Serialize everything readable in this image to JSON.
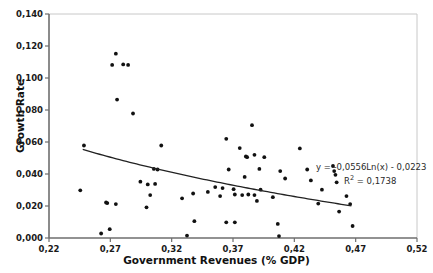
{
  "chart_data": {
    "type": "scatter",
    "title": "",
    "xlabel": "Government Revenues (% GDP)",
    "ylabel": "Growth Rate",
    "xlim": [
      0.22,
      0.52
    ],
    "ylim": [
      0.0,
      0.14
    ],
    "xticks": [
      "0,22",
      "0,27",
      "0,32",
      "0,37",
      "0,42",
      "0,47",
      "0,52"
    ],
    "xtick_values": [
      0.22,
      0.27,
      0.32,
      0.37,
      0.42,
      0.47,
      0.52
    ],
    "yticks": [
      "0,000",
      "0,020",
      "0,040",
      "0,060",
      "0,080",
      "0,100",
      "0,120",
      "0,140"
    ],
    "ytick_values": [
      0.0,
      0.02,
      0.04,
      0.06,
      0.08,
      0.1,
      0.12,
      0.14
    ],
    "grid": false,
    "legend": "none",
    "marker_color": "#111111",
    "trendline_color": "#222222",
    "axis_color": "#808080",
    "annotations": {
      "equation": "y = -0,0556Ln(x) - 0,0223",
      "r_squared_prefix": "R",
      "r_squared_exponent": "2",
      "r_squared_value": " = 0,1738"
    },
    "trendline": {
      "type": "logarithmic",
      "coefficient": -0.0556,
      "intercept": -0.0223,
      "r_squared": 0.1738,
      "x_start": 0.2475,
      "x_end": 0.4665
    },
    "points": [
      {
        "x": 0.2745,
        "y": 0.1152
      },
      {
        "x": 0.2715,
        "y": 0.1082
      },
      {
        "x": 0.2805,
        "y": 0.1085
      },
      {
        "x": 0.2845,
        "y": 0.1082
      },
      {
        "x": 0.2755,
        "y": 0.0865
      },
      {
        "x": 0.2885,
        "y": 0.0778
      },
      {
        "x": 0.3855,
        "y": 0.0705
      },
      {
        "x": 0.3645,
        "y": 0.062
      },
      {
        "x": 0.2485,
        "y": 0.0578
      },
      {
        "x": 0.3115,
        "y": 0.0578
      },
      {
        "x": 0.3755,
        "y": 0.0562
      },
      {
        "x": 0.4245,
        "y": 0.056
      },
      {
        "x": 0.3875,
        "y": 0.052
      },
      {
        "x": 0.3805,
        "y": 0.051
      },
      {
        "x": 0.3815,
        "y": 0.0505
      },
      {
        "x": 0.3955,
        "y": 0.0505
      },
      {
        "x": 0.4515,
        "y": 0.045
      },
      {
        "x": 0.3055,
        "y": 0.0432
      },
      {
        "x": 0.3085,
        "y": 0.0428
      },
      {
        "x": 0.3665,
        "y": 0.0428
      },
      {
        "x": 0.3915,
        "y": 0.0432
      },
      {
        "x": 0.4305,
        "y": 0.0428
      },
      {
        "x": 0.4525,
        "y": 0.0418
      },
      {
        "x": 0.4085,
        "y": 0.0418
      },
      {
        "x": 0.4535,
        "y": 0.0395
      },
      {
        "x": 0.3795,
        "y": 0.0382
      },
      {
        "x": 0.4125,
        "y": 0.0372
      },
      {
        "x": 0.2945,
        "y": 0.0352
      },
      {
        "x": 0.4335,
        "y": 0.036
      },
      {
        "x": 0.3005,
        "y": 0.0335
      },
      {
        "x": 0.3065,
        "y": 0.0338
      },
      {
        "x": 0.4545,
        "y": 0.0348
      },
      {
        "x": 0.3555,
        "y": 0.0318
      },
      {
        "x": 0.3615,
        "y": 0.0312
      },
      {
        "x": 0.3705,
        "y": 0.0305
      },
      {
        "x": 0.3925,
        "y": 0.0302
      },
      {
        "x": 0.4425,
        "y": 0.0302
      },
      {
        "x": 0.2455,
        "y": 0.0298
      },
      {
        "x": 0.3495,
        "y": 0.0288
      },
      {
        "x": 0.3025,
        "y": 0.0268
      },
      {
        "x": 0.3375,
        "y": 0.0278
      },
      {
        "x": 0.3715,
        "y": 0.0272
      },
      {
        "x": 0.3775,
        "y": 0.0268
      },
      {
        "x": 0.3825,
        "y": 0.0272
      },
      {
        "x": 0.3875,
        "y": 0.0268
      },
      {
        "x": 0.3595,
        "y": 0.0262
      },
      {
        "x": 0.4625,
        "y": 0.0262
      },
      {
        "x": 0.4025,
        "y": 0.0255
      },
      {
        "x": 0.3285,
        "y": 0.0248
      },
      {
        "x": 0.2665,
        "y": 0.0222
      },
      {
        "x": 0.2675,
        "y": 0.0218
      },
      {
        "x": 0.2745,
        "y": 0.0212
      },
      {
        "x": 0.3895,
        "y": 0.0232
      },
      {
        "x": 0.4655,
        "y": 0.0212
      },
      {
        "x": 0.4395,
        "y": 0.0215
      },
      {
        "x": 0.2995,
        "y": 0.0192
      },
      {
        "x": 0.4565,
        "y": 0.0165
      },
      {
        "x": 0.3385,
        "y": 0.0105
      },
      {
        "x": 0.3645,
        "y": 0.0098
      },
      {
        "x": 0.3715,
        "y": 0.0098
      },
      {
        "x": 0.4065,
        "y": 0.0088
      },
      {
        "x": 0.4675,
        "y": 0.0075
      },
      {
        "x": 0.2695,
        "y": 0.0055
      },
      {
        "x": 0.3325,
        "y": 0.0015
      },
      {
        "x": 0.2625,
        "y": 0.0028
      },
      {
        "x": 0.4075,
        "y": 0.0012
      }
    ]
  }
}
